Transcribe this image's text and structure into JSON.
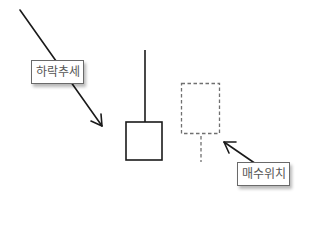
{
  "diagram": {
    "type": "candlestick-annotation",
    "labels": {
      "downtrend": "하락추세",
      "buy_position": "매수위치"
    },
    "elements": [
      {
        "kind": "arrow",
        "meaning": "downtrend",
        "from": [
          20,
          10
        ],
        "to": [
          102,
          126
        ]
      },
      {
        "kind": "candle",
        "style": "solid",
        "wick_top": 50,
        "body_top": 122,
        "body_bottom": 160,
        "x_left": 126,
        "x_right": 162
      },
      {
        "kind": "candle",
        "style": "dashed",
        "body_top": 83,
        "body_bottom": 133,
        "wick_bottom": 162,
        "x_left": 181,
        "x_right": 220
      },
      {
        "kind": "arrow",
        "meaning": "buy-position-pointer",
        "from": [
          256,
          164
        ],
        "to": [
          224,
          142
        ]
      }
    ],
    "colors": {
      "line": "#1a1a1a",
      "dashed": "#707070",
      "label_text": "#555555",
      "label_border": "#6a6a6a"
    }
  }
}
